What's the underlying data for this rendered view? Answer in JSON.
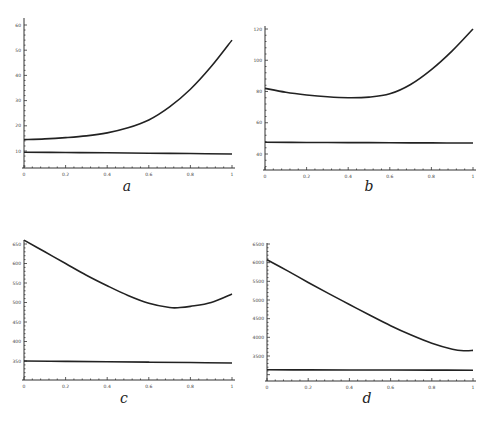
{
  "chart_data": [
    {
      "panel": "a",
      "type": "line",
      "xlim": [
        0,
        1
      ],
      "ylim": [
        4,
        62
      ],
      "xticks": [
        0,
        0.2,
        0.4,
        0.6,
        0.8,
        1
      ],
      "yticks": [
        10,
        20,
        30,
        40,
        50,
        60
      ],
      "series": [
        {
          "name": "upper",
          "x": [
            0,
            0.1,
            0.2,
            0.3,
            0.4,
            0.5,
            0.6,
            0.7,
            0.8,
            0.9,
            1
          ],
          "values": [
            14.5,
            14.8,
            15.3,
            16.0,
            17.2,
            19.2,
            22.3,
            27.5,
            34.5,
            43.5,
            54.0
          ]
        },
        {
          "name": "lower",
          "x": [
            0,
            0.2,
            0.4,
            0.6,
            0.8,
            1
          ],
          "values": [
            9.5,
            9.4,
            9.3,
            9.1,
            9.0,
            8.8
          ]
        }
      ],
      "label": "a",
      "grid": false
    },
    {
      "panel": "b",
      "type": "line",
      "xlim": [
        0,
        1
      ],
      "ylim": [
        33,
        121
      ],
      "xticks": [
        0,
        0.2,
        0.4,
        0.6,
        0.8,
        1
      ],
      "yticks": [
        40,
        60,
        80,
        100,
        120
      ],
      "series": [
        {
          "name": "upper",
          "x": [
            0,
            0.1,
            0.2,
            0.3,
            0.4,
            0.5,
            0.6,
            0.7,
            0.8,
            0.9,
            1
          ],
          "values": [
            82,
            79.5,
            77.8,
            76.6,
            76.0,
            76.4,
            78.5,
            84.5,
            94.0,
            106.0,
            120.0
          ]
        },
        {
          "name": "lower",
          "x": [
            0,
            0.2,
            0.4,
            0.6,
            0.8,
            1
          ],
          "values": [
            47.5,
            47.4,
            47.3,
            47.2,
            47.1,
            47.0
          ]
        }
      ],
      "label": "b",
      "grid": false
    },
    {
      "panel": "c",
      "type": "line",
      "xlim": [
        0,
        1
      ],
      "ylim": [
        315,
        662
      ],
      "xticks": [
        0,
        0.2,
        0.4,
        0.6,
        0.8,
        1
      ],
      "yticks": [
        350,
        400,
        450,
        500,
        550,
        600,
        650
      ],
      "series": [
        {
          "name": "upper",
          "x": [
            0,
            0.1,
            0.2,
            0.3,
            0.4,
            0.5,
            0.6,
            0.7,
            0.75,
            0.8,
            0.9,
            1
          ],
          "values": [
            660,
            630,
            600,
            570,
            543,
            518,
            498,
            487,
            487,
            490,
            500,
            522
          ]
        },
        {
          "name": "lower",
          "x": [
            0,
            0.2,
            0.4,
            0.6,
            0.8,
            1
          ],
          "values": [
            350,
            349,
            348,
            347,
            346,
            345
          ]
        }
      ],
      "label": "c",
      "grid": false
    },
    {
      "panel": "d",
      "type": "line",
      "xlim": [
        0,
        1
      ],
      "ylim": [
        3000,
        6550
      ],
      "xticks": [
        0,
        0.2,
        0.4,
        0.6,
        0.8,
        1
      ],
      "yticks": [
        3500,
        4000,
        4500,
        5000,
        5500,
        6000,
        6500
      ],
      "series": [
        {
          "name": "upper",
          "x": [
            0,
            0.1,
            0.2,
            0.3,
            0.4,
            0.5,
            0.6,
            0.7,
            0.8,
            0.9,
            0.96,
            1
          ],
          "values": [
            6080,
            5780,
            5470,
            5170,
            4880,
            4590,
            4310,
            4060,
            3840,
            3680,
            3640,
            3650
          ]
        },
        {
          "name": "lower",
          "x": [
            0,
            0.2,
            0.4,
            0.6,
            0.8,
            1
          ],
          "values": [
            3130,
            3128,
            3126,
            3124,
            3122,
            3120
          ]
        }
      ],
      "label": "d",
      "grid": false
    }
  ],
  "panels": {
    "a": {
      "label": "a",
      "xtick_labels": [
        "0",
        "0.2",
        "0.4",
        "0.6",
        "0.8",
        "1"
      ],
      "ytick_labels": [
        "10",
        "20",
        "30",
        "40",
        "50",
        "60"
      ]
    },
    "b": {
      "label": "b",
      "xtick_labels": [
        "0",
        "0.2",
        "0.4",
        "0.6",
        "0.8",
        "1"
      ],
      "ytick_labels": [
        "40",
        "60",
        "80",
        "100",
        "120"
      ]
    },
    "c": {
      "label": "c",
      "xtick_labels": [
        "0",
        "0.2",
        "0.4",
        "0.6",
        "0.8",
        "1"
      ],
      "ytick_labels": [
        "350",
        "400",
        "450",
        "500",
        "550",
        "600",
        "650"
      ]
    },
    "d": {
      "label": "d",
      "xtick_labels": [
        "0",
        "0.2",
        "0.4",
        "0.6",
        "0.8",
        "1"
      ],
      "ytick_labels": [
        "3500",
        "4000",
        "4500",
        "5000",
        "5500",
        "6000",
        "6500"
      ]
    }
  }
}
